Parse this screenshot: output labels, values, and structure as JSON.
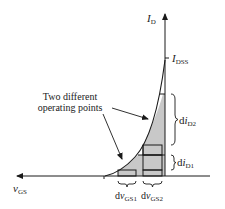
{
  "diagram": {
    "axes": {
      "y_label": "I",
      "y_label_sub": "D",
      "x_label": "v",
      "x_label_sub": "GS"
    },
    "markers": {
      "idss_label": "I",
      "idss_sub": "DSS"
    },
    "annotation": {
      "line1": "Two different",
      "line2": "operating points"
    },
    "braces": {
      "di_d2": {
        "prefix": "d",
        "var": "i",
        "sub": "D2"
      },
      "di_d1": {
        "prefix": "d",
        "var": "i",
        "sub": "D1"
      },
      "dv_gs1": {
        "prefix": "d",
        "var": "v",
        "sub": "GS1"
      },
      "dv_gs2": {
        "prefix": "d",
        "var": "v",
        "sub": "GS2"
      }
    },
    "colors": {
      "shade": "#c8c8c8",
      "line": "#1a1a1a"
    }
  }
}
